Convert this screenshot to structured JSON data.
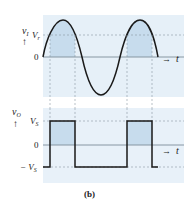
{
  "figure": {
    "caption": "(b)",
    "colors": {
      "panel_bg": "#e6f0f8",
      "shade": "#c7dced",
      "curve": "#1a1a1a",
      "axis": "#7d8c99",
      "dashed": "#8a97a3",
      "text": "#222222"
    }
  },
  "top_plot": {
    "y_label": "v",
    "y_label_sub": "I",
    "y_arrow": "↑",
    "ticks": [
      {
        "label": "V",
        "sub": "r",
        "level": "Vr"
      },
      {
        "label": "0",
        "sub": "",
        "level": "0"
      }
    ],
    "x_label": "t",
    "x_arrow": "→",
    "signal": "sine"
  },
  "bottom_plot": {
    "y_label": "v",
    "y_label_sub": "O",
    "y_arrow": "↑",
    "ticks": [
      {
        "label": "V",
        "sub": "S",
        "level": "Vs"
      },
      {
        "label": "0",
        "sub": "",
        "level": "0"
      },
      {
        "label": "− V",
        "sub": "S",
        "level": "-Vs"
      }
    ],
    "x_label": "t",
    "x_arrow": "→",
    "signal": "square"
  }
}
